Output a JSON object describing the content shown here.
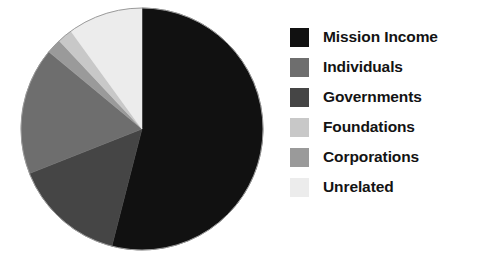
{
  "chart_data": {
    "type": "pie",
    "title": "",
    "subtitle": "",
    "xlabel": "",
    "ylabel": "",
    "grid": false,
    "legend_position": "right",
    "start_angle_deg": 0,
    "direction": "clockwise",
    "categories": [
      "Mission Income",
      "Individuals",
      "Governments",
      "Foundations",
      "Corporations",
      "Unrelated"
    ],
    "values": [
      54,
      17,
      15,
      2,
      2,
      10
    ],
    "units": "percent",
    "colors": [
      "#111111",
      "#6e6e6e",
      "#454545",
      "#c8c8c8",
      "#9a9a9a",
      "#ececec"
    ],
    "slices": [
      {
        "label": "Mission Income",
        "value": 54,
        "color": "#111111",
        "start_deg": 0,
        "end_deg": 194.4
      },
      {
        "label": "Governments",
        "value": 15,
        "color": "#454545",
        "start_deg": 194.4,
        "end_deg": 248.4
      },
      {
        "label": "Individuals",
        "value": 17,
        "color": "#6e6e6e",
        "start_deg": 248.4,
        "end_deg": 309.6
      },
      {
        "label": "Corporations",
        "value": 2,
        "color": "#9a9a9a",
        "start_deg": 309.6,
        "end_deg": 316.8
      },
      {
        "label": "Foundations",
        "value": 2,
        "color": "#c8c8c8",
        "start_deg": 316.8,
        "end_deg": 324.0
      },
      {
        "label": "Unrelated",
        "value": 10,
        "color": "#ececec",
        "start_deg": 324.0,
        "end_deg": 360.0
      }
    ]
  },
  "pie": {
    "center_x": 142,
    "center_y": 129,
    "radius": 121,
    "outline_color": "#9b9b9b"
  },
  "legend": {
    "items": [
      {
        "label": "Mission Income",
        "color": "#111111"
      },
      {
        "label": "Individuals",
        "color": "#6e6e6e"
      },
      {
        "label": "Governments",
        "color": "#454545"
      },
      {
        "label": "Foundations",
        "color": "#c8c8c8"
      },
      {
        "label": "Corporations",
        "color": "#9a9a9a"
      },
      {
        "label": "Unrelated",
        "color": "#ececec"
      }
    ]
  }
}
